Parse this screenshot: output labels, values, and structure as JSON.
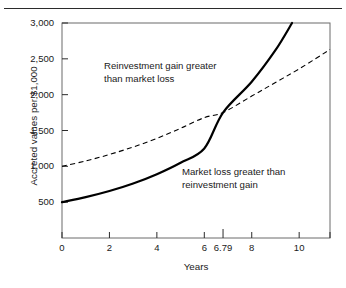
{
  "chart_data": {
    "type": "line",
    "title": "",
    "xlabel": "Years",
    "ylabel": "Accreted values per $1,000",
    "xlim": [
      0,
      11.3
    ],
    "ylim": [
      0,
      3000
    ],
    "grid": false,
    "legend": "none",
    "x_ticks": [
      {
        "value": 0,
        "label": "0",
        "emphasized": false
      },
      {
        "value": 2,
        "label": "2",
        "emphasized": false
      },
      {
        "value": 4,
        "label": "4",
        "emphasized": false
      },
      {
        "value": 6,
        "label": "6",
        "emphasized": false
      },
      {
        "value": 6.79,
        "label": "6.79",
        "emphasized": true
      },
      {
        "value": 8,
        "label": "8",
        "emphasized": false
      },
      {
        "value": 10,
        "label": "10",
        "emphasized": false
      }
    ],
    "y_ticks": [
      {
        "value": 500,
        "label": "500"
      },
      {
        "value": 1000,
        "label": "1,000"
      },
      {
        "value": 1500,
        "label": "1,500"
      },
      {
        "value": 2000,
        "label": "2,000"
      },
      {
        "value": 2500,
        "label": "2,500"
      },
      {
        "value": 3000,
        "label": "3,000"
      }
    ],
    "crossover": {
      "x": 6.79,
      "y": 1750,
      "label": "6.79"
    },
    "series": [
      {
        "name": "Reinvestment gain (accreted value)",
        "style": "solid",
        "color": "#000000",
        "x": [
          0,
          1,
          2,
          3,
          4,
          5,
          6,
          6.79,
          8,
          9,
          10,
          11.3
        ],
        "y": [
          1000,
          1075,
          1165,
          1270,
          1390,
          1530,
          1680,
          1750,
          1980,
          2170,
          2360,
          2630
        ]
      },
      {
        "name": "Market loss",
        "style": "dashed",
        "color": "#000000",
        "x": [
          0,
          1,
          2,
          3,
          4,
          5,
          6,
          6.79,
          8,
          9,
          9.7
        ],
        "y": [
          500,
          570,
          655,
          760,
          890,
          1050,
          1250,
          1750,
          2180,
          2620,
          3000
        ]
      }
    ],
    "annotations": [
      {
        "id": "upper",
        "text": "Reinvestment gain greater\nthan market loss",
        "region": "upper-left"
      },
      {
        "id": "lower",
        "text": "Market loss greater than\nreinvestment gain",
        "region": "lower-right"
      }
    ]
  }
}
